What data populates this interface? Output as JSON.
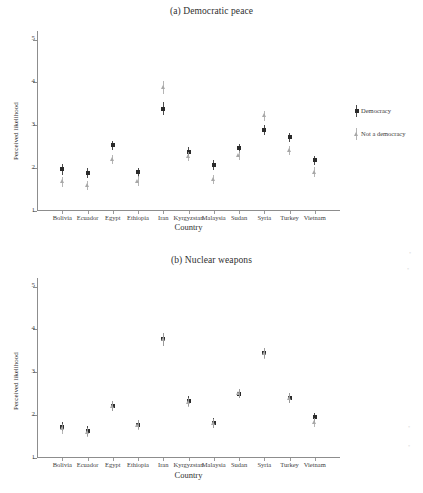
{
  "figure": {
    "panels": [
      {
        "id": "panel-a",
        "title": "(a) Democratic peace",
        "xlabel": "Country",
        "ylabel": "Perceived likelihood"
      },
      {
        "id": "panel-b",
        "title": "(b) Nuclear weapons",
        "xlabel": "Country",
        "ylabel": "Perceived likelihood"
      }
    ]
  },
  "chart_data": [
    {
      "type": "scatter",
      "title": "(a) Democratic peace",
      "xlabel": "Country",
      "ylabel": "Perceived likelihood",
      "ylim": [
        1,
        5.2
      ],
      "yticks": [
        1,
        2,
        3,
        4,
        5
      ],
      "grid": false,
      "legend_position": "right",
      "categories": [
        "Bolivia",
        "Ecuador",
        "Egypt",
        "Ethiopia",
        "Iran",
        "Kyrgyzstan",
        "Malaysia",
        "Sudan",
        "Syria",
        "Turkey",
        "Vietnam"
      ],
      "series": [
        {
          "name": "Democracy",
          "marker": "square",
          "color": "#2b2b2b",
          "values": [
            1.97,
            1.89,
            2.53,
            1.9,
            3.39,
            2.38,
            2.07,
            2.46,
            2.89,
            2.72,
            2.18
          ],
          "ci_low": [
            1.85,
            1.78,
            2.42,
            1.79,
            3.24,
            2.27,
            1.96,
            2.35,
            2.77,
            2.61,
            2.07
          ],
          "ci_high": [
            2.09,
            2.0,
            2.64,
            2.01,
            3.54,
            2.49,
            2.18,
            2.57,
            3.01,
            2.83,
            2.29
          ]
        },
        {
          "name": "Not a democracy",
          "marker": "triangle",
          "color": "#a8a8a8",
          "values": [
            1.68,
            1.59,
            2.2,
            1.7,
            3.89,
            2.27,
            1.73,
            2.3,
            3.22,
            2.41,
            1.91
          ],
          "ci_low": [
            1.57,
            1.48,
            2.09,
            1.59,
            3.74,
            2.16,
            1.62,
            2.19,
            3.1,
            2.3,
            1.8
          ],
          "ci_high": [
            1.79,
            1.7,
            2.31,
            1.81,
            4.04,
            2.38,
            1.84,
            2.41,
            3.34,
            2.52,
            2.02
          ]
        }
      ]
    },
    {
      "type": "scatter",
      "title": "(b) Nuclear weapons",
      "xlabel": "Country",
      "ylabel": "Perceived likelihood",
      "ylim": [
        1,
        5.2
      ],
      "yticks": [
        1,
        2,
        3,
        4,
        5
      ],
      "grid": false,
      "legend_position": "right",
      "categories": [
        "Bolivia",
        "Ecuador",
        "Egypt",
        "Ethiopia",
        "Iran",
        "Kyrgyzstan",
        "Malaysia",
        "Sudan",
        "Syria",
        "Turkey",
        "Vietnam"
      ],
      "series": [
        {
          "name": "Conventional weapons 45% effective",
          "marker": "square",
          "color": "#2b2b2b",
          "values": [
            1.73,
            1.63,
            2.21,
            1.78,
            3.77,
            2.33,
            1.82,
            2.5,
            3.45,
            2.4,
            1.95
          ],
          "ci_low": [
            1.62,
            1.52,
            2.1,
            1.67,
            3.62,
            2.22,
            1.71,
            2.39,
            3.33,
            2.29,
            1.84
          ],
          "ci_high": [
            1.84,
            1.74,
            2.32,
            1.89,
            3.92,
            2.44,
            1.93,
            2.61,
            3.57,
            2.51,
            2.06
          ]
        },
        {
          "name": "Conventional weapons 90% effective",
          "marker": "triangle",
          "color": "#a8a8a8",
          "values": [
            1.68,
            1.6,
            2.21,
            1.77,
            3.77,
            2.3,
            1.8,
            2.5,
            3.44,
            2.4,
            1.83
          ],
          "ci_low": [
            1.57,
            1.49,
            2.1,
            1.66,
            3.62,
            2.19,
            1.69,
            2.39,
            3.32,
            2.29,
            1.72
          ],
          "ci_high": [
            1.79,
            1.71,
            2.32,
            1.88,
            3.92,
            2.41,
            1.91,
            2.61,
            3.56,
            2.51,
            1.94
          ]
        }
      ]
    }
  ],
  "panel_a": {
    "title": "(a) Democratic peace",
    "xlabel": "Country",
    "ylabel": "Perceived likelihood",
    "yticks": [
      "1",
      "2",
      "3",
      "4",
      "5"
    ],
    "xticks": [
      "Bolivia",
      "Ecuador",
      "Egypt",
      "Ethiopia",
      "Iran",
      "Kyrgyzstan",
      "Malaysia",
      "Sudan",
      "Syria",
      "Turkey",
      "Vietnam"
    ],
    "legend": [
      {
        "label": "Democracy",
        "marker": "square",
        "color": "#2b2b2b"
      },
      {
        "label": "Not a democracy",
        "marker": "triangle",
        "color": "#a8a8a8"
      }
    ]
  },
  "panel_b": {
    "title": "(b) Nuclear weapons",
    "xlabel": "Country",
    "ylabel": "Perceived likelihood",
    "yticks": [
      "1",
      "2",
      "3",
      "4",
      "5"
    ],
    "xticks": [
      "Bolivia",
      "Ecuador",
      "Egypt",
      "Ethiopia",
      "Iran",
      "Kyrgyzstan",
      "Malaysia",
      "Sudan",
      "Syria",
      "Turkey",
      "Vietnam"
    ],
    "legend": [
      {
        "label": "Conventional\nweapons\n45% effective",
        "marker": "square",
        "color": "#2b2b2b"
      },
      {
        "label": "Conventional\nweapons\n90% effective",
        "marker": "triangle",
        "color": "#a8a8a8"
      }
    ]
  }
}
